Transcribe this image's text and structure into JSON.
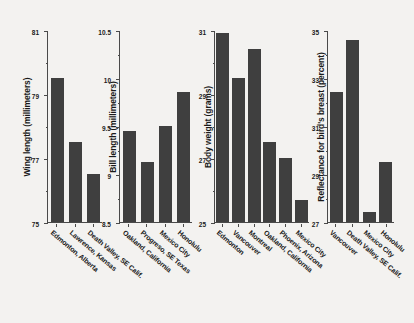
{
  "figure": {
    "background_color": "#f3f2f0",
    "bar_color": "#3f3f3f",
    "axis_color": "#4a4a4a"
  },
  "chart_data": [
    {
      "type": "bar",
      "title": "",
      "xlabel": "",
      "ylabel": "Wing length (millimeters)",
      "ylim": [
        75,
        81
      ],
      "yticks": [
        75,
        77,
        79,
        81
      ],
      "yticklabels": [
        "75",
        "77",
        "79",
        "81"
      ],
      "yminorticks": [
        76,
        78,
        80
      ],
      "grid": false,
      "legend": "none",
      "categories": [
        "Edmonton, Alberta",
        "Lawrence, Kansas",
        "Death Valley, SE Calif."
      ],
      "values": [
        79.5,
        77.5,
        76.5
      ]
    },
    {
      "type": "bar",
      "title": "",
      "xlabel": "",
      "ylabel": "Bill length (millimeters)",
      "ylim": [
        8.5,
        10.5
      ],
      "yticks": [
        8.5,
        9,
        9.5,
        10,
        10.5
      ],
      "yticklabels": [
        "8.5",
        "9",
        "9.5",
        "10",
        "10.5"
      ],
      "yminorticks": [
        8.75,
        9.25,
        9.75,
        10.25
      ],
      "grid": false,
      "legend": "none",
      "categories": [
        "Oakland, California",
        "Progreso, SE Texas",
        "Mexico City",
        "Honolulu"
      ],
      "values": [
        9.45,
        9.12,
        9.5,
        9.85
      ]
    },
    {
      "type": "bar",
      "title": "",
      "xlabel": "",
      "ylabel": "Body weight (grams)",
      "ylim": [
        25,
        31
      ],
      "yticks": [
        25,
        27,
        29,
        31
      ],
      "yticklabels": [
        "25",
        "27",
        "29",
        "31"
      ],
      "yminorticks": [
        26,
        28,
        30
      ],
      "grid": false,
      "legend": "none",
      "categories": [
        "Edmonton",
        "Vancouver",
        "Montreal",
        "Oakland, California",
        "Phoenix, Arizona",
        "Mexico City"
      ],
      "values": [
        30.9,
        29.5,
        30.4,
        27.5,
        27.0,
        25.7
      ]
    },
    {
      "type": "bar",
      "title": "",
      "xlabel": "",
      "ylabel": "Reflectance for bird's breast (percent)",
      "ylim": [
        27,
        35
      ],
      "yticks": [
        27,
        29,
        31,
        33,
        35
      ],
      "yticklabels": [
        "27",
        "29",
        "31",
        "33",
        "35"
      ],
      "yminorticks": [
        28,
        30,
        32,
        34
      ],
      "grid": false,
      "legend": "none",
      "categories": [
        "Vancouver",
        "Death Valley, SE Calif.",
        "Mexico City",
        "Honolulu"
      ],
      "values": [
        32.4,
        34.6,
        27.4,
        29.5
      ]
    }
  ]
}
